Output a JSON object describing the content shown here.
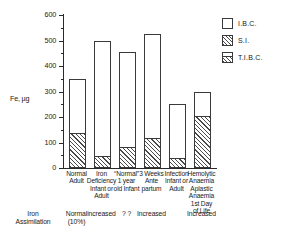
{
  "chart_data": {
    "type": "bar",
    "title": "",
    "xlabel": "",
    "ylabel": "Fe, µg",
    "ylim": [
      0,
      600
    ],
    "ytick_labels": [
      "600",
      "500",
      "400",
      "300",
      "200",
      "100",
      "0"
    ],
    "yticks": [
      600,
      500,
      400,
      300,
      200,
      100,
      0
    ],
    "minor_ticks": [
      550,
      450,
      350,
      250,
      150,
      50
    ],
    "grid": false,
    "legend_position": "top-right",
    "stacked": true,
    "categories": [
      "Normal\nAdult",
      "Iron\nDeficiency\nInfant or\nAdult",
      "“Normal”\n1 year\nold Infant",
      "3 Weeks\nAnte\npartum",
      "Infection\nInfant or\nAdult",
      "Hemolytic\nAnaemia\nAplastic\nAnaemia\n1st Day\nof Life"
    ],
    "series": [
      {
        "name": "S.I.",
        "fill": "hatched",
        "values": [
          135,
          45,
          80,
          115,
          35,
          200
        ]
      },
      {
        "name": "I.B.C.",
        "fill": "white",
        "values": [
          215,
          455,
          375,
          410,
          215,
          100
        ]
      }
    ],
    "totals_name": "T.I.B.C.",
    "totals": [
      350,
      500,
      455,
      525,
      250,
      300
    ],
    "legend": [
      {
        "label": "I.B.C.",
        "swatch": "white"
      },
      {
        "label": "S.I.",
        "swatch": "hatched"
      },
      {
        "label": "T.I.B.C.",
        "swatch": "split"
      }
    ],
    "annotations_row": {
      "title": "Iron\nAssimilation",
      "values": [
        "Normal\n(10%)",
        "increased",
        "? ?",
        "Increased",
        "",
        "Increased"
      ]
    }
  }
}
